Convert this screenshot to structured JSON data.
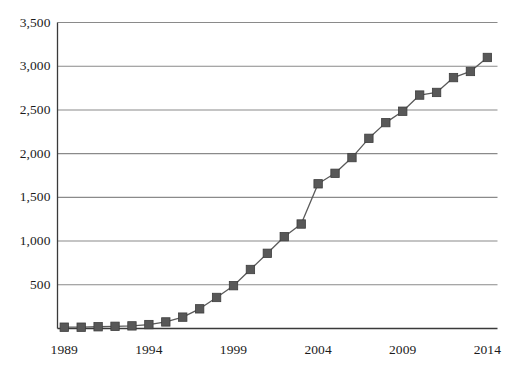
{
  "chart_data": {
    "type": "line",
    "title": "",
    "subtitle": "",
    "xlabel": "",
    "ylabel": "",
    "grid": true,
    "legend": false,
    "legend_position": "none",
    "marker": "square",
    "marker_color": "#585858",
    "line_color": "#5a5a5a",
    "grid_color": "#8a8a8a",
    "axis_color": "#3a3a3a",
    "xlim": [
      1988.6,
      2014.6
    ],
    "ylim": [
      0,
      3500
    ],
    "ytick_labels": [
      "3,500",
      "3,000",
      "2,500",
      "2,000",
      "1,500",
      "1,000",
      "500"
    ],
    "ytick_values": [
      3500,
      3000,
      2500,
      2000,
      1500,
      1000,
      500
    ],
    "xtick_labels": [
      "1989",
      "1994",
      "1999",
      "2004",
      "2009",
      "2014"
    ],
    "xtick_values": [
      1989,
      1994,
      1999,
      2004,
      2009,
      2014
    ],
    "x": [
      1989,
      1990,
      1991,
      1992,
      1993,
      1994,
      1995,
      1996,
      1997,
      1998,
      1999,
      2000,
      2001,
      2002,
      2003,
      2004,
      2005,
      2006,
      2007,
      2008,
      2009,
      2010,
      2011,
      2012,
      2013,
      2014
    ],
    "values": [
      15,
      15,
      20,
      25,
      30,
      45,
      75,
      130,
      225,
      355,
      490,
      675,
      860,
      1050,
      1195,
      1655,
      1775,
      1955,
      2175,
      2355,
      2485,
      2670,
      2700,
      2870,
      2940,
      3100
    ],
    "series": [
      {
        "name": "",
        "values": [
          15,
          15,
          20,
          25,
          30,
          45,
          75,
          130,
          225,
          355,
          490,
          675,
          860,
          1050,
          1195,
          1655,
          1775,
          1955,
          2175,
          2355,
          2485,
          2670,
          2700,
          2870,
          2940,
          3100
        ]
      }
    ]
  }
}
